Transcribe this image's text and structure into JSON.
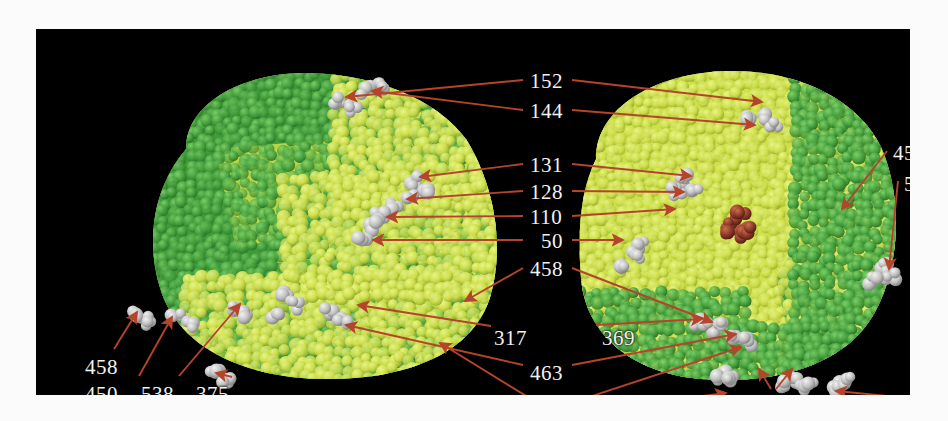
{
  "figure": {
    "type": "molecular-structure-space-filling",
    "background_color": "#ffffff",
    "panel_color": "#000000",
    "panel": {
      "x": 36,
      "y": 29,
      "width": 874,
      "height": 366
    }
  },
  "palette": {
    "subunit_dark_green": "#3f9a3a",
    "subunit_light_green": "#55ab45",
    "subunit_yellow": "#cfe04c",
    "subunit_yellow_light": "#dced63",
    "highlight_gray": "#bdbdbd",
    "highlight_gray_light": "#e2e2e2",
    "ligand_red": "#8f3a2a",
    "ligand_red_light": "#b8563c",
    "arrow_red": "#b5442a",
    "label_text": "#f2f2f2"
  },
  "structure": {
    "subunits": [
      {
        "name": "left-monomer",
        "colors": [
          "#3f9a3a",
          "#cfe04c"
        ]
      },
      {
        "name": "right-monomer",
        "colors": [
          "#cfe04c",
          "#3f9a3a"
        ]
      }
    ],
    "ligand": {
      "name": "heme-ligand",
      "color": "#8f3a2a"
    }
  },
  "labels": [
    {
      "id": "l-152",
      "text": "152",
      "x": 494,
      "y": 42,
      "group": "top-center"
    },
    {
      "id": "l-144",
      "text": "144",
      "x": 494,
      "y": 72,
      "group": "top-center"
    },
    {
      "id": "l-131",
      "text": "131",
      "x": 494,
      "y": 126,
      "group": "mid-center"
    },
    {
      "id": "l-128",
      "text": "128",
      "x": 494,
      "y": 153,
      "group": "mid-center"
    },
    {
      "id": "l-110",
      "text": "110",
      "x": 494,
      "y": 178,
      "group": "mid-center"
    },
    {
      "id": "l-50",
      "text": "50",
      "x": 505,
      "y": 202,
      "group": "mid-center"
    },
    {
      "id": "l-458c",
      "text": "458",
      "x": 494,
      "y": 230,
      "group": "mid-center"
    },
    {
      "id": "l-317",
      "text": "317",
      "x": 458,
      "y": 299,
      "group": "lower-center"
    },
    {
      "id": "l-369",
      "text": "369",
      "x": 566,
      "y": 299,
      "group": "lower-center"
    },
    {
      "id": "l-463",
      "text": "463",
      "x": 494,
      "y": 334,
      "group": "lower-center"
    },
    {
      "id": "l-41",
      "text": "41",
      "x": 504,
      "y": 372,
      "group": "lower-center"
    },
    {
      "id": "l-458l",
      "text": "458",
      "x": 49,
      "y": 328,
      "group": "bottom-left"
    },
    {
      "id": "l-450l",
      "text": "450",
      "x": 49,
      "y": 355,
      "group": "bottom-left"
    },
    {
      "id": "l-538l",
      "text": "538",
      "x": 105,
      "y": 355,
      "group": "bottom-left"
    },
    {
      "id": "l-375l",
      "text": "375",
      "x": 160,
      "y": 355,
      "group": "bottom-left"
    },
    {
      "id": "l-450r",
      "text": "450",
      "x": 857,
      "y": 114,
      "group": "right-side"
    },
    {
      "id": "l-538r",
      "text": "538",
      "x": 868,
      "y": 145,
      "group": "right-side"
    },
    {
      "id": "l-21l",
      "text": "21",
      "x": 603,
      "y": 371,
      "group": "bottom-right"
    },
    {
      "id": "l-375r",
      "text": "375",
      "x": 719,
      "y": 371,
      "group": "bottom-right"
    },
    {
      "id": "l-21r",
      "text": "21",
      "x": 877,
      "y": 371,
      "group": "bottom-right"
    }
  ],
  "leader_lines": [
    {
      "for": "152",
      "from": [
        487,
        51
      ],
      "to": [
        310,
        68
      ],
      "arrow": "end"
    },
    {
      "for": "152b",
      "from": [
        536,
        51
      ],
      "to": [
        726,
        73
      ],
      "arrow": "end"
    },
    {
      "for": "144",
      "from": [
        487,
        81
      ],
      "to": [
        336,
        62
      ],
      "arrow": "end"
    },
    {
      "for": "144b",
      "from": [
        536,
        81
      ],
      "to": [
        719,
        96
      ],
      "arrow": "end"
    },
    {
      "for": "131",
      "from": [
        487,
        135
      ],
      "to": [
        384,
        148
      ],
      "arrow": "end"
    },
    {
      "for": "131b",
      "from": [
        536,
        135
      ],
      "to": [
        655,
        147
      ],
      "arrow": "end"
    },
    {
      "for": "128",
      "from": [
        487,
        162
      ],
      "to": [
        371,
        170
      ],
      "arrow": "end"
    },
    {
      "for": "128b",
      "from": [
        536,
        162
      ],
      "to": [
        648,
        163
      ],
      "arrow": "end"
    },
    {
      "for": "110",
      "from": [
        487,
        187
      ],
      "to": [
        351,
        188
      ],
      "arrow": "end"
    },
    {
      "for": "110b",
      "from": [
        536,
        187
      ],
      "to": [
        639,
        180
      ],
      "arrow": "end"
    },
    {
      "for": "50",
      "from": [
        487,
        211
      ],
      "to": [
        337,
        211
      ],
      "arrow": "end"
    },
    {
      "for": "50b",
      "from": [
        536,
        211
      ],
      "to": [
        587,
        211
      ],
      "arrow": "end"
    },
    {
      "for": "458c",
      "from": [
        487,
        239
      ],
      "to": [
        429,
        272
      ],
      "arrow": "end"
    },
    {
      "for": "458c2",
      "from": [
        536,
        239
      ],
      "to": [
        676,
        293
      ],
      "arrow": "end"
    },
    {
      "for": "317",
      "from": [
        455,
        297
      ],
      "to": [
        322,
        276
      ],
      "arrow": "end"
    },
    {
      "for": "369",
      "from": [
        560,
        296
      ],
      "to": [
        666,
        290
      ],
      "arrow": "end"
    },
    {
      "for": "463",
      "from": [
        487,
        336
      ],
      "to": [
        310,
        296
      ],
      "arrow": "end"
    },
    {
      "for": "463b",
      "from": [
        536,
        336
      ],
      "to": [
        700,
        305
      ],
      "arrow": "end"
    },
    {
      "for": "41",
      "from": [
        500,
        373
      ],
      "to": [
        404,
        314
      ],
      "arrow": "end"
    },
    {
      "for": "41b",
      "from": [
        538,
        373
      ],
      "to": [
        705,
        318
      ],
      "arrow": "end"
    },
    {
      "for": "458l",
      "from": [
        78,
        320
      ],
      "to": [
        101,
        283
      ],
      "arrow": "end"
    },
    {
      "for": "450l",
      "from": [
        103,
        347
      ],
      "to": [
        136,
        288
      ],
      "arrow": "end"
    },
    {
      "for": "538l",
      "from": [
        143,
        347
      ],
      "to": [
        204,
        275
      ],
      "arrow": "end"
    },
    {
      "for": "375l",
      "from": [
        196,
        348
      ],
      "to": [
        180,
        344
      ],
      "arrow": "end"
    },
    {
      "for": "450r",
      "from": [
        851,
        122
      ],
      "to": [
        806,
        180
      ],
      "arrow": "end"
    },
    {
      "for": "538r",
      "from": [
        862,
        152
      ],
      "to": [
        853,
        240
      ],
      "arrow": "end"
    },
    {
      "for": "21l",
      "from": [
        628,
        372
      ],
      "to": [
        690,
        364
      ],
      "arrow": "end"
    },
    {
      "for": "375r",
      "from": [
        735,
        360
      ],
      "to": [
        723,
        340
      ],
      "arrow": "end"
    },
    {
      "for": "375r2",
      "from": [
        740,
        360
      ],
      "to": [
        756,
        340
      ],
      "arrow": "end"
    },
    {
      "for": "21r",
      "from": [
        872,
        369
      ],
      "to": [
        800,
        362
      ],
      "arrow": "end"
    }
  ]
}
